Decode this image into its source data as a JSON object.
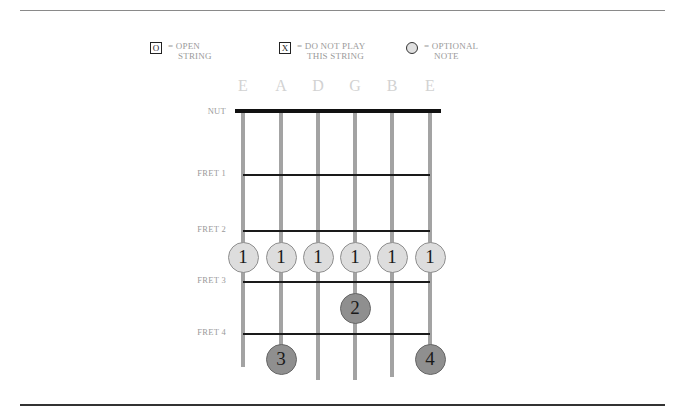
{
  "legend": {
    "open": {
      "symbol": "O",
      "line1": "= OPEN",
      "line2": "STRING"
    },
    "mute": {
      "symbol": "X",
      "line1": "= DO NOT PLAY",
      "line2": "THIS STRING"
    },
    "optional": {
      "line1": "= OPTIONAL",
      "line2": "NOTE"
    }
  },
  "strings": [
    {
      "name": "E",
      "x": 243,
      "bottom": 367
    },
    {
      "name": "A",
      "x": 281,
      "bottom": 374
    },
    {
      "name": "D",
      "x": 318,
      "bottom": 380
    },
    {
      "name": "G",
      "x": 355,
      "bottom": 380
    },
    {
      "name": "B",
      "x": 392,
      "bottom": 377
    },
    {
      "name": "E",
      "x": 430,
      "bottom": 374
    }
  ],
  "nut_label": "NUT",
  "frets": [
    {
      "label": "FRET 1",
      "y": 174
    },
    {
      "label": "FRET 2",
      "y": 230
    },
    {
      "label": "FRET 3",
      "y": 281
    },
    {
      "label": "FRET 4",
      "y": 333
    }
  ],
  "fingers": [
    {
      "string": 0,
      "y": 257,
      "finger": "1",
      "style": "light"
    },
    {
      "string": 1,
      "y": 257,
      "finger": "1",
      "style": "light"
    },
    {
      "string": 2,
      "y": 257,
      "finger": "1",
      "style": "light"
    },
    {
      "string": 3,
      "y": 257,
      "finger": "1",
      "style": "light"
    },
    {
      "string": 4,
      "y": 257,
      "finger": "1",
      "style": "light"
    },
    {
      "string": 5,
      "y": 257,
      "finger": "1",
      "style": "light"
    },
    {
      "string": 3,
      "y": 308,
      "finger": "2",
      "style": "dark"
    },
    {
      "string": 1,
      "y": 359,
      "finger": "3",
      "style": "dark"
    },
    {
      "string": 5,
      "y": 359,
      "finger": "4",
      "style": "dark"
    }
  ],
  "colors": {
    "string": "#a3a3a3",
    "nut": "#111111",
    "fret": "#1a1a1a",
    "dot_light": "#dddddd",
    "dot_dark": "#8f8f8f",
    "label": "#9a9a9a"
  }
}
